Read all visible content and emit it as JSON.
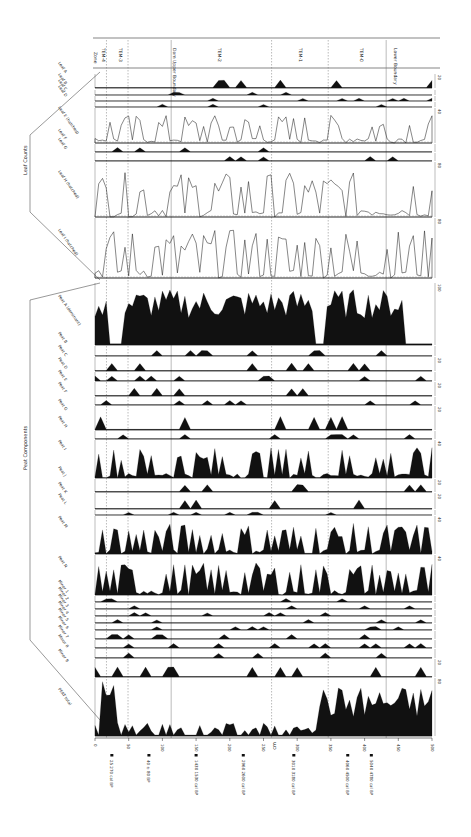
{
  "figure": {
    "orientation": "rotated-90",
    "depth_axis": {
      "label": "cm",
      "ticks": [
        "0",
        "50",
        "100",
        "150",
        "200",
        "250",
        "300",
        "350",
        "400",
        "450",
        "500"
      ],
      "range": [
        0,
        500
      ]
    },
    "zones": {
      "header": "Zone",
      "labels": [
        "TEM-4",
        "TEM-3",
        "Dam Upper Boundary",
        "TEM-2",
        "TEM-1",
        "TEM-0",
        "Lower Boundary"
      ],
      "boundaries_cm": [
        17,
        49,
        113,
        262,
        346,
        432
      ]
    },
    "groups": [
      {
        "name": "Leaf Counts"
      },
      {
        "name": "Peat Components"
      }
    ],
    "dates": [
      {
        "depth_cm": 25,
        "label": "25 270 cal BP"
      },
      {
        "depth_cm": 80,
        "label": "40 ± 80 BP"
      },
      {
        "depth_cm": 150,
        "label": "1430 1530 cal BP"
      },
      {
        "depth_cm": 220,
        "label": "2960 2600 cal BP"
      },
      {
        "depth_cm": 295,
        "label": "3010 3180 cal BP"
      },
      {
        "depth_cm": 375,
        "label": "4060 4500 cal BP"
      },
      {
        "depth_cm": 410,
        "label": "5040 4780 cal BP"
      }
    ],
    "panels": [
      {
        "name": "Leaf A",
        "top": 74,
        "h": 14,
        "scale": "20"
      },
      {
        "name": "Leaf B",
        "top": 90,
        "h": 5,
        "scale": ""
      },
      {
        "name": "Leaf C",
        "top": 96,
        "h": 5,
        "scale": ""
      },
      {
        "name": "Leaf D",
        "top": 102,
        "h": 5,
        "scale": ""
      },
      {
        "name": "Leaf E (hatched)",
        "top": 108,
        "h": 35,
        "scale": "40"
      },
      {
        "name": "Leaf F",
        "top": 144,
        "h": 8,
        "scale": ""
      },
      {
        "name": "Leaf G",
        "top": 153,
        "h": 8,
        "scale": ""
      },
      {
        "name": "Leaf H (hatched)",
        "top": 162,
        "h": 55,
        "scale": "80"
      },
      {
        "name": "Leaf I (hatched)",
        "top": 218,
        "h": 60,
        "scale": "80"
      },
      {
        "name": "Peat A (dominant)",
        "top": 283,
        "h": 62,
        "scale": "100"
      },
      {
        "name": "Peat B",
        "top": 346,
        "h": 10,
        "scale": ""
      },
      {
        "name": "Peat C",
        "top": 357,
        "h": 14,
        "scale": "20"
      },
      {
        "name": "Peat D",
        "top": 372,
        "h": 9,
        "scale": ""
      },
      {
        "name": "Peat E",
        "top": 382,
        "h": 14,
        "scale": "20"
      },
      {
        "name": "Peat F",
        "top": 397,
        "h": 8,
        "scale": ""
      },
      {
        "name": "Peat G",
        "top": 406,
        "h": 24,
        "scale": "20"
      },
      {
        "name": "Peat H",
        "top": 431,
        "h": 8,
        "scale": ""
      },
      {
        "name": "Peat I",
        "top": 440,
        "h": 38,
        "scale": "40"
      },
      {
        "name": "Peat J",
        "top": 479,
        "h": 13,
        "scale": "20"
      },
      {
        "name": "Peat K",
        "top": 493,
        "h": 16,
        "scale": "20"
      },
      {
        "name": "Peat L",
        "top": 510,
        "h": 5,
        "scale": ""
      },
      {
        "name": "Peat M",
        "top": 516,
        "h": 38,
        "scale": "40"
      },
      {
        "name": "Peat N",
        "top": 555,
        "h": 40,
        "scale": "40"
      },
      {
        "name": "Minor 1",
        "top": 596,
        "h": 6,
        "scale": ""
      },
      {
        "name": "Minor 2",
        "top": 603,
        "h": 6,
        "scale": ""
      },
      {
        "name": "Minor 3",
        "top": 610,
        "h": 6,
        "scale": ""
      },
      {
        "name": "Minor 4",
        "top": 617,
        "h": 6,
        "scale": ""
      },
      {
        "name": "Minor 5",
        "top": 624,
        "h": 6,
        "scale": ""
      },
      {
        "name": "Minor 6",
        "top": 631,
        "h": 8,
        "scale": ""
      },
      {
        "name": "Minor 7",
        "top": 640,
        "h": 8,
        "scale": ""
      },
      {
        "name": "Minor 8",
        "top": 649,
        "h": 9,
        "scale": ""
      },
      {
        "name": "Minor 9",
        "top": 659,
        "h": 18,
        "scale": "20"
      },
      {
        "name": "PEAT total",
        "top": 678,
        "h": 58,
        "scale": "80"
      }
    ]
  }
}
